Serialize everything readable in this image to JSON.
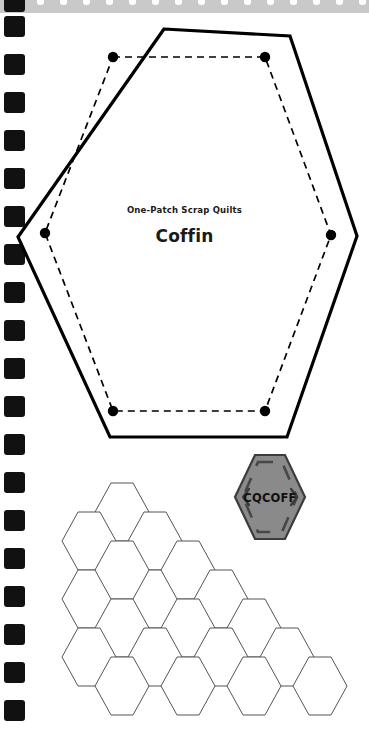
{
  "page": {
    "background_color": "#ffffff",
    "width": 369,
    "height": 752
  },
  "binding": {
    "name": "spiral-notebook-binding",
    "bar_color": "#c9c9c9",
    "hole_color": "#111111",
    "hole_count": 19,
    "hole_spacing": 38,
    "top_dot_count": 16
  },
  "template_block": {
    "name": "coffin-hexagon-template",
    "subtitle": "One-Patch Scrap Quilts",
    "title": "Coffin",
    "outline_color": "#000000",
    "seamline_color": "#000000",
    "seamline_style": "dashed",
    "vertex_dot_count": 6,
    "outer_points": "164,29 290,36 357,236 287,437 110,437 18,237",
    "inner_points": "113,57 265,57 331,235 265,411 113,411 45,233",
    "vertex_dots": [
      {
        "x": 113,
        "y": 57
      },
      {
        "x": 265,
        "y": 57
      },
      {
        "x": 331,
        "y": 235
      },
      {
        "x": 265,
        "y": 411
      },
      {
        "x": 113,
        "y": 411
      },
      {
        "x": 45,
        "y": 233
      }
    ]
  },
  "badge": {
    "name": "pattern-code-badge",
    "code": "CQCOFF",
    "fill_color": "#8a8a8a",
    "border_color": "#3c3c3c",
    "bracket_color": "#474747",
    "text_color": "#111111",
    "center_x": 270,
    "center_y": 497,
    "half_width": 35,
    "half_height": 42
  },
  "tessellation": {
    "name": "hexagon-tessellation-diagram",
    "stroke_color": "#555555",
    "stroke_width": 1,
    "hex_half_width": 27,
    "hex_half_height": 29,
    "hex_flat_half": 11,
    "description": "staircase honeycomb of coffin hexagons",
    "cells": [
      {
        "cx": 122,
        "cy": 512
      },
      {
        "cx": 89,
        "cy": 541
      },
      {
        "cx": 155,
        "cy": 541
      },
      {
        "cx": 89,
        "cy": 599
      },
      {
        "cx": 155,
        "cy": 599
      },
      {
        "cx": 122,
        "cy": 570
      },
      {
        "cx": 188,
        "cy": 570
      },
      {
        "cx": 221,
        "cy": 599
      },
      {
        "cx": 188,
        "cy": 628
      },
      {
        "cx": 122,
        "cy": 628
      },
      {
        "cx": 254,
        "cy": 628
      },
      {
        "cx": 89,
        "cy": 657
      },
      {
        "cx": 155,
        "cy": 657
      },
      {
        "cx": 221,
        "cy": 657
      },
      {
        "cx": 287,
        "cy": 657
      },
      {
        "cx": 122,
        "cy": 686
      },
      {
        "cx": 188,
        "cy": 686
      },
      {
        "cx": 254,
        "cy": 686
      },
      {
        "cx": 320,
        "cy": 686
      }
    ]
  }
}
